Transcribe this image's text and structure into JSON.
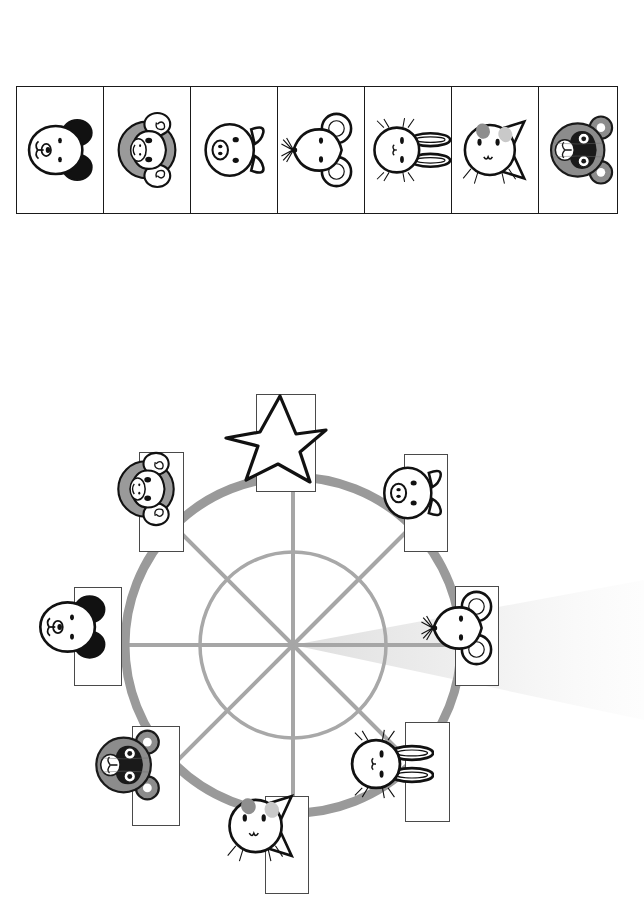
{
  "page": {
    "kind": "worksheet-diagram",
    "background_color": "#ffffff"
  },
  "strip": {
    "name": "animal-face-strip",
    "cell_count": 7,
    "border_color": "#1a1a1a",
    "cells": [
      {
        "index": 1,
        "animal": "dog",
        "icon": "dog-face-icon",
        "rotation_deg": 90,
        "fill": "#ffffff",
        "accent": "#111111"
      },
      {
        "index": 2,
        "animal": "monkey",
        "icon": "monkey-face-icon",
        "rotation_deg": 90,
        "fill": "#ffffff",
        "accent": "#9a9a9a"
      },
      {
        "index": 3,
        "animal": "pig",
        "icon": "pig-face-icon",
        "rotation_deg": 90,
        "fill": "#ffffff",
        "accent": "#111111"
      },
      {
        "index": 4,
        "animal": "mouse",
        "icon": "mouse-face-icon",
        "rotation_deg": 90,
        "fill": "#ffffff",
        "accent": "#111111"
      },
      {
        "index": 5,
        "animal": "rabbit",
        "icon": "rabbit-face-icon",
        "rotation_deg": 90,
        "fill": "#ffffff",
        "accent": "#111111"
      },
      {
        "index": 6,
        "animal": "cat",
        "icon": "cat-face-icon",
        "rotation_deg": 90,
        "fill": "#ffffff",
        "accent": "#a8a8a8"
      },
      {
        "index": 7,
        "animal": "raccoon",
        "icon": "raccoon-face-icon",
        "rotation_deg": 90,
        "fill": "#8c8c8c",
        "accent": "#1a1a1a"
      }
    ]
  },
  "wheel": {
    "name": "animal-wheel-diagram",
    "outer_ring_color": "#9a9a9a",
    "inner_circle_color": "#a8a8a8",
    "spoke_color": "#a0a0a0",
    "spoke_count": 8,
    "center": {
      "x": 293,
      "y": 263
    },
    "outer_radius": 168,
    "inner_radius": 93,
    "beam": {
      "name": "light-beam",
      "color": "#efefef",
      "direction": "right"
    },
    "marker": {
      "name": "star-marker",
      "icon": "star-icon",
      "position": "top",
      "stroke": "#111111",
      "fill": "#ffffff"
    },
    "nodes": [
      {
        "slot": 1,
        "angle_deg": 45,
        "position": "top-right",
        "animal": "pig",
        "icon": "pig-face-icon",
        "rotation_deg": 90
      },
      {
        "slot": 2,
        "angle_deg": 90,
        "position": "right",
        "animal": "mouse",
        "icon": "mouse-face-icon",
        "rotation_deg": 90
      },
      {
        "slot": 3,
        "angle_deg": 135,
        "position": "bottom-right",
        "animal": "rabbit",
        "icon": "rabbit-face-icon",
        "rotation_deg": 90
      },
      {
        "slot": 4,
        "angle_deg": 180,
        "position": "bottom",
        "animal": "cat",
        "icon": "cat-face-icon",
        "rotation_deg": 90
      },
      {
        "slot": 5,
        "angle_deg": 225,
        "position": "bottom-left",
        "animal": "raccoon",
        "icon": "raccoon-face-icon",
        "rotation_deg": 90
      },
      {
        "slot": 6,
        "angle_deg": 270,
        "position": "left",
        "animal": "dog",
        "icon": "dog-face-icon",
        "rotation_deg": 90
      },
      {
        "slot": 7,
        "angle_deg": 315,
        "position": "top-left",
        "animal": "monkey",
        "icon": "monkey-face-icon",
        "rotation_deg": 90
      },
      {
        "slot": 8,
        "angle_deg": 0,
        "position": "top",
        "animal": "star",
        "icon": "star-icon",
        "rotation_deg": 0
      }
    ]
  }
}
